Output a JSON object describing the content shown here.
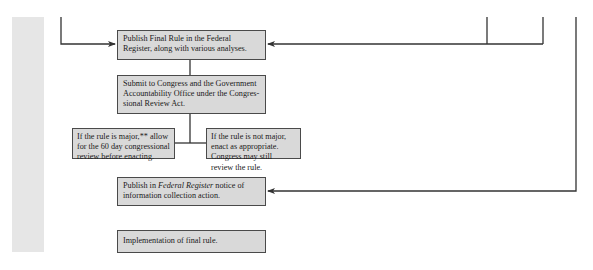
{
  "diagram": {
    "boxes": {
      "publish_final_rule": "Publish Final Rule in the Federal Register, along with various analyses.",
      "submit_congress": "Submit to Congress and the Government Accountability Office under the Congres-sional Review Act.",
      "major_rule": "If the rule is major,** allow for the 60 day congressional review before enacting.",
      "not_major_rule": "If the rule is not major, enact as appropriate. Congress may still review the rule.",
      "publish_notice_prefix": "Publish in ",
      "publish_notice_italic": "Federal Register",
      "publish_notice_suffix": " notice of information collection action.",
      "implementation": "Implementation of final rule."
    },
    "colors": {
      "box_fill": "#d9d9d9",
      "box_border": "#4a4a4a",
      "line": "#333333",
      "sidebar": "#e6e6e6"
    }
  }
}
